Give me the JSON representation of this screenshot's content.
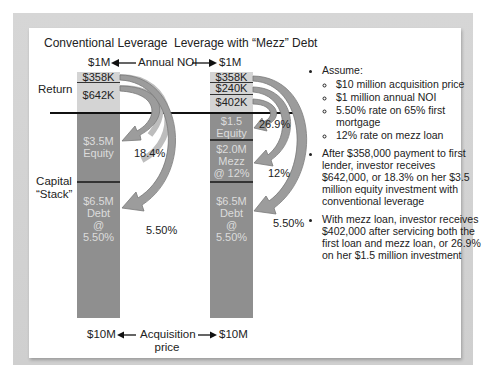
{
  "titles": {
    "left": "Conventional Leverage",
    "right": "Leverage with “Mezz” Debt"
  },
  "noi_row": {
    "left_value": "$1M",
    "label": "Annual NOI",
    "right_value": "$1M",
    "left_arrow": "←",
    "right_arrow": "→"
  },
  "side_labels": {
    "return": "Return",
    "capital_stack_line1": "Capital",
    "capital_stack_line2": "“Stack”"
  },
  "left_stack": {
    "returns": [
      {
        "label": "$358K"
      },
      {
        "label": "$642K"
      }
    ],
    "equity": {
      "line1": "$3.5M",
      "line2": "Equity"
    },
    "debt": {
      "line1": "$6.5M",
      "line2": "Debt",
      "line3": "@",
      "line4": "5.50%"
    },
    "equity_rate": "18.4%",
    "debt_rate": "5.50%"
  },
  "right_stack": {
    "returns": [
      {
        "label": "$358K"
      },
      {
        "label": "$240K"
      },
      {
        "label": "$402K"
      }
    ],
    "equity": {
      "line1": "$1.5",
      "line2": "Equity"
    },
    "mezz": {
      "line1": "$2.0M",
      "line2": "Mezz",
      "line3": "@ 12%"
    },
    "debt": {
      "line1": "$6.5M",
      "line2": "Debt",
      "line3": "@",
      "line4": "5.50%"
    },
    "equity_rate": "26.9%",
    "mezz_rate": "12%",
    "debt_rate": "5.50%"
  },
  "acquisition_row": {
    "left_value": "$10M",
    "label_line1": "Acquisition",
    "label_line2": "price",
    "right_value": "$10M",
    "left_arrow": "←",
    "right_arrow": "→"
  },
  "notes": {
    "assume_heading": "Assume:",
    "assumptions": [
      "$10 million acquisition price",
      "$1 million annual NOI",
      "5.50% rate on 65% first mortgage",
      "12% rate on mezz loan"
    ],
    "point_conventional": "After $358,000 payment to first lender, investor receives $642,000, or 18.3% on her $3.5 million equity investment with conventional leverage",
    "point_mezz": "With mezz loan, investor receives $402,000 after servicing both the first loan and mezz loan, or 26.9% on her $1.5 million investment"
  },
  "colors": {
    "light_segment": "#d4d4d4",
    "dark_segment": "#8f8f8f",
    "arrow_fill": "#b8b8b8",
    "frame": "#d2d2d2"
  }
}
